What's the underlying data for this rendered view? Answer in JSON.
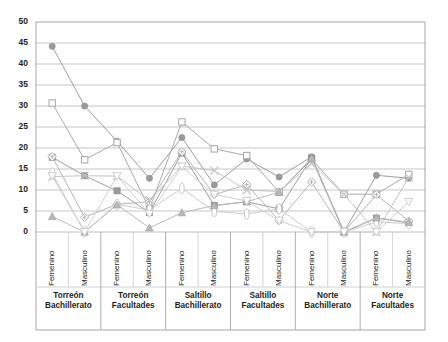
{
  "chart_data": {
    "type": "line",
    "title": "",
    "xlabel": "",
    "ylabel": "",
    "ylim": [
      0,
      50
    ],
    "yticks": [
      0,
      5,
      10,
      15,
      20,
      25,
      30,
      35,
      40,
      45,
      50
    ],
    "grid": true,
    "legend": "none",
    "categories": [
      "Femenino",
      "Masculino",
      "Femenino",
      "Masculino",
      "Femenino",
      "Masculino",
      "Femenino",
      "Masculino",
      "Femenino",
      "Masculino",
      "Femenino",
      "Masculino"
    ],
    "group_labels": [
      "Torreón Bachillerato",
      "Torreón Facultades",
      "Saltillo Bachillerato",
      "Saltillo Facultades",
      "Norte Bachillerato",
      "Norte Facultades"
    ],
    "groups": [
      {
        "line1": "Torreón",
        "line2": "Bachillerato"
      },
      {
        "line1": "Torreón",
        "line2": "Facultades"
      },
      {
        "line1": "Saltillo",
        "line2": "Bachillerato"
      },
      {
        "line1": "Saltillo",
        "line2": "Facultades"
      },
      {
        "line1": "Norte",
        "line2": "Bachillerato"
      },
      {
        "line1": "Norte",
        "line2": "Facultades"
      }
    ],
    "series": [
      {
        "name": "Serie 1",
        "marker": "filled-circle",
        "color": "#9a9a9a",
        "values": [
          44.2,
          30.0,
          21.6,
          12.8,
          22.5,
          11.2,
          17.4,
          13.1,
          17.9,
          0.0,
          13.5,
          12.8
        ]
      },
      {
        "name": "Serie 2",
        "marker": "open-square",
        "color": "#a6a6a6",
        "values": [
          30.7,
          17.2,
          21.3,
          5.5,
          26.2,
          19.8,
          18.2,
          9.5,
          17.3,
          9.0,
          9.0,
          13.7
        ]
      },
      {
        "name": "Serie 3",
        "marker": "filled-square",
        "color": "#9a9a9a",
        "values": [
          17.8,
          13.4,
          9.8,
          4.6,
          18.8,
          6.3,
          7.2,
          5.5,
          17.6,
          0.0,
          3.3,
          2.2
        ]
      },
      {
        "name": "Serie 4",
        "marker": "diamond-plus",
        "color": "#b3b3b3",
        "values": [
          17.9,
          3.5,
          6.6,
          7.2,
          19.1,
          8.9,
          11.3,
          2.7,
          11.9,
          0.0,
          8.9,
          2.6
        ]
      },
      {
        "name": "Serie 5",
        "marker": "x-cross",
        "color": "#c2c2c2",
        "values": [
          13.2,
          13.4,
          13.3,
          7.5,
          15.7,
          14.6,
          10.0,
          9.6,
          16.3,
          9.0,
          0.0,
          13.0
        ]
      },
      {
        "name": "Serie 6",
        "marker": "open-ellipse",
        "color": "#c9c9c9",
        "values": [
          14.0,
          0.0,
          6.6,
          5.2,
          10.4,
          4.9,
          4.3,
          5.5,
          0.0,
          0.0,
          2.4,
          2.0
        ]
      },
      {
        "name": "Serie 7",
        "marker": "filled-triangle",
        "color": "#b8b8b8",
        "values": [
          3.7,
          0.0,
          6.5,
          1.0,
          4.6,
          6.3,
          7.2,
          9.5,
          17.6,
          0.0,
          3.4,
          2.3
        ]
      },
      {
        "name": "Serie 8",
        "marker": "open-triangle-down",
        "color": "#cfcfcf",
        "values": [
          13.3,
          0.0,
          13.3,
          4.3,
          15.6,
          8.9,
          7.4,
          2.7,
          0.0,
          0.0,
          0.0,
          7.2
        ]
      }
    ]
  }
}
